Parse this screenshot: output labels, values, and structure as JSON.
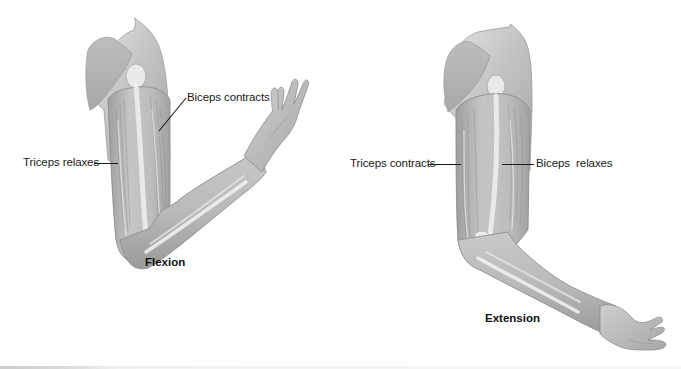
{
  "figure": {
    "panels": [
      {
        "id": "flexion",
        "caption": "Flexion",
        "labels": {
          "biceps": "Biceps contracts",
          "triceps": "Triceps relaxes"
        }
      },
      {
        "id": "extension",
        "caption": "Extension",
        "labels": {
          "triceps": "Triceps contracts",
          "biceps": "Biceps  relaxes"
        }
      }
    ]
  },
  "colors": {
    "background": "#ffffff",
    "skin_shade": "#a9a9a9",
    "skin_mid": "#c4c4c4",
    "skin_light": "#dcdcdc",
    "bone_highlight": "#f2f2f2",
    "outline": "#8a8a8a",
    "text": "#1a1a1a"
  }
}
